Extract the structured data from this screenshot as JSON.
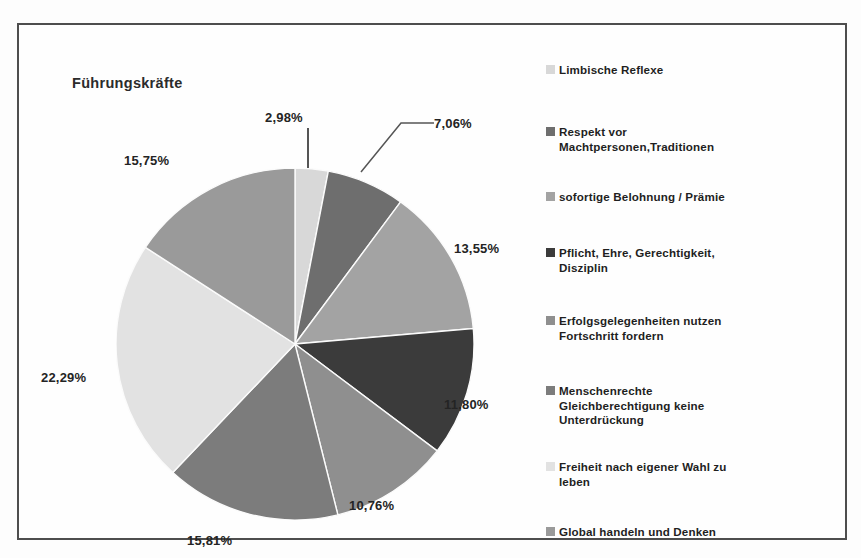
{
  "chart_data": {
    "type": "pie",
    "title": "Führungskräfte",
    "xlabel": "",
    "ylabel": "",
    "legend_position": "right",
    "grid": false,
    "value_suffix": "%",
    "decimal_separator": ",",
    "categories": [
      "Limbische Reflexe",
      "Respekt vor Machtpersonen,Traditionen",
      "sofortige Belohnung / Prämie",
      "Pflicht, Ehre, Gerechtigkeit, Disziplin",
      "Erfolgsgelegenheiten nutzen Fortschritt fordern",
      "Menschenrechte Gleichberechtigung keine Unterdrückung",
      "Freiheit nach eigener Wahl zu leben",
      "Global handeln und Denken"
    ],
    "values": [
      2.98,
      7.06,
      13.55,
      11.8,
      10.76,
      15.81,
      22.29,
      15.75
    ],
    "value_labels": [
      "2,98%",
      "7,06%",
      "13,55%",
      "11,80%",
      "10,76%",
      "15,81%",
      "22,29%",
      "15,75%"
    ],
    "colors": [
      "#d8d8d8",
      "#6e6e6e",
      "#a3a3a3",
      "#3b3b3b",
      "#8f8f8f",
      "#7c7c7c",
      "#e2e2e2",
      "#9a9a9a"
    ]
  },
  "title": "Führungskräfte",
  "slices": [
    {
      "label": "2,98%",
      "value": 2.98,
      "color": "#d8d8d8"
    },
    {
      "label": "7,06%",
      "value": 7.06,
      "color": "#6e6e6e"
    },
    {
      "label": "13,55%",
      "value": 13.55,
      "color": "#a3a3a3"
    },
    {
      "label": "11,80%",
      "value": 11.8,
      "color": "#3b3b3b"
    },
    {
      "label": "10,76%",
      "value": 10.76,
      "color": "#8f8f8f"
    },
    {
      "label": "15,81%",
      "value": 15.81,
      "color": "#7c7c7c"
    },
    {
      "label": "22,29%",
      "value": 22.29,
      "color": "#e2e2e2"
    },
    {
      "label": "15,75%",
      "value": 15.75,
      "color": "#9a9a9a"
    }
  ],
  "legend": {
    "items": [
      {
        "label": "Limbische Reflexe",
        "color": "#d8d8d8",
        "top": 8
      },
      {
        "label": "Respekt vor\nMachtpersonen,Traditionen",
        "color": "#6e6e6e",
        "top": 70
      },
      {
        "label": "sofortige Belohnung / Prämie",
        "color": "#a3a3a3",
        "top": 135
      },
      {
        "label": "Pflicht, Ehre, Gerechtigkeit,\nDisziplin",
        "color": "#3b3b3b",
        "top": 191
      },
      {
        "label": "Erfolgsgelegenheiten nutzen\nFortschritt fordern",
        "color": "#8f8f8f",
        "top": 259
      },
      {
        "label": "Menschenrechte\nGleichberechtigung  keine\nUnterdrückung",
        "color": "#7c7c7c",
        "top": 329
      },
      {
        "label": "Freiheit nach eigener Wahl zu\nleben",
        "color": "#e2e2e2",
        "top": 405
      },
      {
        "label": "Global handeln  und Denken",
        "color": "#9a9a9a",
        "top": 470
      }
    ]
  },
  "callouts": [
    {
      "name": "label-2-98",
      "text": "2,98%",
      "left": 246,
      "top": 85
    },
    {
      "name": "label-7-06",
      "text": "7,06%",
      "left": 415,
      "top": 91
    },
    {
      "name": "label-13-55",
      "text": "13,55%",
      "left": 435,
      "top": 216
    },
    {
      "name": "label-11-80",
      "text": "11,80%",
      "left": 425,
      "top": 372
    },
    {
      "name": "label-10-76",
      "text": "10,76%",
      "left": 330,
      "top": 473
    },
    {
      "name": "label-15-81",
      "text": "15,81%",
      "left": 168,
      "top": 508
    },
    {
      "name": "label-22-29",
      "text": "22,29%",
      "left": 22,
      "top": 345
    },
    {
      "name": "label-15-75",
      "text": "15,75%",
      "left": 105,
      "top": 128
    }
  ]
}
